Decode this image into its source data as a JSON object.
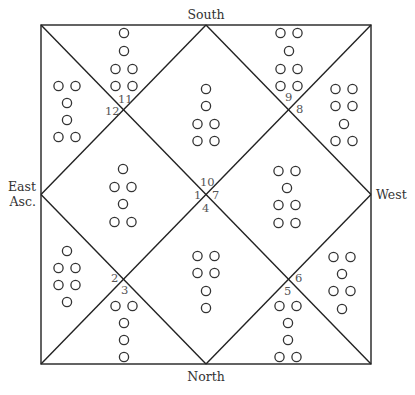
{
  "diagram": {
    "type": "north-indian-astrology-chart",
    "square": {
      "left": 41,
      "top": 25,
      "right": 371,
      "bottom": 364
    },
    "colors": {
      "line": "#222222",
      "text": "#333333",
      "house_number": "#555555",
      "background": "#ffffff"
    },
    "directions": {
      "top": "South",
      "bottom": "North",
      "right": "West",
      "left_line1": "East",
      "left_line2": "Asc."
    },
    "house_numbers": [
      {
        "n": "1",
        "x": 194,
        "y": 199
      },
      {
        "n": "2",
        "x": 111,
        "y": 282
      },
      {
        "n": "3",
        "x": 121,
        "y": 294
      },
      {
        "n": "4",
        "x": 202,
        "y": 212
      },
      {
        "n": "5",
        "x": 284,
        "y": 295
      },
      {
        "n": "6",
        "x": 295,
        "y": 282
      },
      {
        "n": "7",
        "x": 212,
        "y": 199
      },
      {
        "n": "8",
        "x": 296,
        "y": 113
      },
      {
        "n": "9",
        "x": 285,
        "y": 101
      },
      {
        "n": "10",
        "x": 200,
        "y": 186
      },
      {
        "n": "11",
        "x": 118,
        "y": 103
      },
      {
        "n": "12",
        "x": 105,
        "y": 115
      }
    ],
    "houses": [
      {
        "house": 1,
        "cx": 123,
        "rows_y": [
          169,
          187,
          204,
          222
        ],
        "pattern": [
          1,
          2,
          1,
          2
        ]
      },
      {
        "house": 2,
        "cx": 67,
        "rows_y": [
          251,
          268,
          285,
          302
        ],
        "pattern": [
          1,
          2,
          2,
          1
        ]
      },
      {
        "house": 3,
        "cx": 124,
        "rows_y": [
          306,
          323,
          340,
          357
        ],
        "pattern": [
          2,
          1,
          1,
          1
        ]
      },
      {
        "house": 4,
        "cx": 206,
        "rows_y": [
          256,
          273,
          291,
          308
        ],
        "pattern": [
          2,
          2,
          1,
          1
        ]
      },
      {
        "house": 5,
        "cx": 288,
        "rows_y": [
          306,
          323,
          340,
          357
        ],
        "pattern": [
          2,
          1,
          1,
          2
        ]
      },
      {
        "house": 6,
        "cx": 342,
        "rows_y": [
          257,
          274,
          291,
          309
        ],
        "pattern": [
          2,
          1,
          2,
          1
        ]
      },
      {
        "house": 7,
        "cx": 287,
        "rows_y": [
          171,
          188,
          205,
          223
        ],
        "pattern": [
          2,
          1,
          2,
          2
        ]
      },
      {
        "house": 8,
        "cx": 344,
        "rows_y": [
          89,
          106,
          124,
          141
        ],
        "pattern": [
          2,
          2,
          1,
          2
        ]
      },
      {
        "house": 9,
        "cx": 289,
        "rows_y": [
          33,
          51,
          69,
          86
        ],
        "pattern": [
          2,
          1,
          2,
          2
        ]
      },
      {
        "house": 10,
        "cx": 206,
        "rows_y": [
          89,
          106,
          124,
          141
        ],
        "pattern": [
          1,
          1,
          2,
          2
        ]
      },
      {
        "house": 11,
        "cx": 124,
        "rows_y": [
          33,
          51,
          69,
          86
        ],
        "pattern": [
          1,
          1,
          2,
          2
        ]
      },
      {
        "house": 12,
        "cx": 67,
        "rows_y": [
          86,
          103,
          120,
          137
        ],
        "pattern": [
          2,
          1,
          1,
          2
        ]
      }
    ]
  }
}
